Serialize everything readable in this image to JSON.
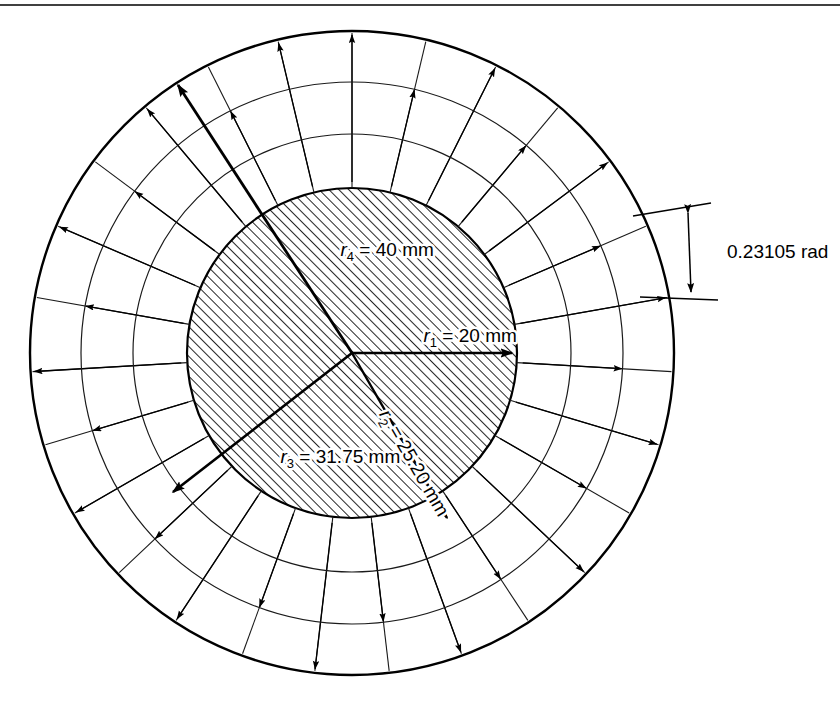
{
  "figure": {
    "background_color": "#ffffff",
    "line_color": "#000000",
    "mesh_line_color": "#1a1a1a",
    "hatch_color": "#000000",
    "top_rule": true
  },
  "geometry": {
    "center_x": 352,
    "center_y": 353,
    "inner_hatched_radius_px": 165,
    "ring_radii_px": [
      165,
      219,
      271,
      322
    ],
    "sector_count": 27,
    "angle_step_rad": 0.23105
  },
  "labels": {
    "r1": {
      "symbol": "r",
      "subscript": "1",
      "text": " = 20 mm",
      "full": "r1 = 20 mm",
      "value": 20,
      "unit": "mm"
    },
    "r2": {
      "symbol": "r",
      "subscript": "2",
      "text": " = 25.20 mm",
      "full": "r2 = 25.20 mm",
      "value": 25.2,
      "unit": "mm"
    },
    "r3": {
      "symbol": "r",
      "subscript": "3",
      "text": " = 31.75 mm",
      "full": "r3 = 31.75 mm",
      "value": 31.75,
      "unit": "mm"
    },
    "r4": {
      "symbol": "r",
      "subscript": "4",
      "text": " = 40 mm",
      "full": "r4 = 40 mm",
      "value": 40,
      "unit": "mm"
    },
    "angle": {
      "full": "0.23105 rad",
      "value": 0.23105,
      "unit": "rad"
    }
  },
  "chart_data": {
    "type": "diagram",
    "radii_mm": [
      20,
      25.2,
      31.75,
      40
    ],
    "radius_labels": [
      "r1 = 20 mm",
      "r2 = 25.20 mm",
      "r3 = 31.75 mm",
      "r4 = 40 mm"
    ],
    "angular_division_rad": 0.23105,
    "sectors": 27,
    "annotations": [
      "0.23105 rad"
    ]
  }
}
